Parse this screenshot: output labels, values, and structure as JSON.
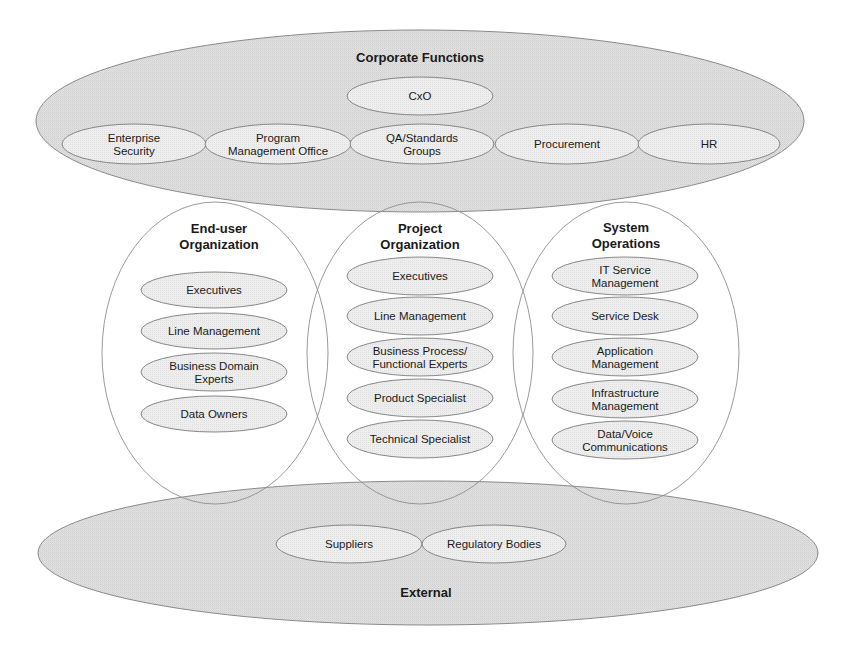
{
  "colors": {
    "outer_fill": "#d9d9d9",
    "item_fill_on_gray": "#eeeeee",
    "item_fill_in_circle": "#e3e3e3",
    "circle_fill": "#ffffff",
    "stroke": "#8a8a8a",
    "text": "#1a1a1a"
  },
  "corporate": {
    "title": "Corporate Functions",
    "shape": {
      "cx": 420,
      "cy": 121,
      "rx": 384,
      "ry": 91
    },
    "title_pos": {
      "x": 420,
      "y": 57
    },
    "items": [
      {
        "id": "cxo",
        "lines": [
          "CxO"
        ],
        "cx": 420,
        "cy": 96,
        "rx": 73,
        "ry": 19
      },
      {
        "id": "enterprise-security",
        "lines": [
          "Enterprise",
          "Security"
        ],
        "cx": 134,
        "cy": 144,
        "rx": 72,
        "ry": 20
      },
      {
        "id": "program-management-office",
        "lines": [
          "Program",
          "Management Office"
        ],
        "cx": 278,
        "cy": 144,
        "rx": 73,
        "ry": 20
      },
      {
        "id": "qa-standards-groups",
        "lines": [
          "QA/Standards",
          "Groups"
        ],
        "cx": 422,
        "cy": 144,
        "rx": 72,
        "ry": 20
      },
      {
        "id": "procurement",
        "lines": [
          "Procurement"
        ],
        "cx": 567,
        "cy": 144,
        "rx": 72,
        "ry": 20
      },
      {
        "id": "hr",
        "lines": [
          "HR"
        ],
        "cx": 709,
        "cy": 144,
        "rx": 71,
        "ry": 20
      }
    ]
  },
  "external": {
    "title": "External",
    "shape": {
      "cx": 428,
      "cy": 553,
      "rx": 390,
      "ry": 72
    },
    "title_pos": {
      "x": 426,
      "y": 592
    },
    "items": [
      {
        "id": "suppliers",
        "lines": [
          "Suppliers"
        ],
        "cx": 349,
        "cy": 544,
        "rx": 73,
        "ry": 19
      },
      {
        "id": "regulatory-bodies",
        "lines": [
          "Regulatory Bodies"
        ],
        "cx": 494,
        "cy": 544,
        "rx": 72,
        "ry": 19
      }
    ]
  },
  "circles": [
    {
      "id": "end-user-organization",
      "title_lines": [
        "End-user",
        "Organization"
      ],
      "shape": {
        "cx": 215,
        "cy": 353,
        "rx": 113,
        "ry": 151
      },
      "title_y": [
        228,
        244
      ],
      "item_cx": 214,
      "item_rx": 73,
      "items": [
        {
          "lines": [
            "Executives"
          ],
          "cy": 290,
          "ry": 18
        },
        {
          "lines": [
            "Line Management"
          ],
          "cy": 331,
          "ry": 18
        },
        {
          "lines": [
            "Business Domain",
            "Experts"
          ],
          "cy": 372,
          "ry": 19
        },
        {
          "lines": [
            "Data Owners"
          ],
          "cy": 414,
          "ry": 18
        }
      ]
    },
    {
      "id": "project-organization",
      "title_lines": [
        "Project",
        "Organization"
      ],
      "shape": {
        "cx": 420,
        "cy": 353,
        "rx": 113,
        "ry": 151
      },
      "title_y": [
        228,
        244
      ],
      "item_cx": 420,
      "item_rx": 73,
      "items": [
        {
          "lines": [
            "Executives"
          ],
          "cy": 276,
          "ry": 19
        },
        {
          "lines": [
            "Line Management"
          ],
          "cy": 316,
          "ry": 19
        },
        {
          "lines": [
            "Business Process/",
            "Functional Experts"
          ],
          "cy": 357,
          "ry": 19
        },
        {
          "lines": [
            "Product Specialist"
          ],
          "cy": 398,
          "ry": 19
        },
        {
          "lines": [
            "Technical Specialist"
          ],
          "cy": 439,
          "ry": 19
        }
      ]
    },
    {
      "id": "system-operations",
      "title_lines": [
        "System",
        "Operations"
      ],
      "shape": {
        "cx": 626,
        "cy": 353,
        "rx": 113,
        "ry": 151
      },
      "title_y": [
        227,
        243
      ],
      "item_cx": 625,
      "item_rx": 73,
      "items": [
        {
          "lines": [
            "IT Service",
            "Management"
          ],
          "cy": 276,
          "ry": 19
        },
        {
          "lines": [
            "Service Desk"
          ],
          "cy": 316,
          "ry": 19
        },
        {
          "lines": [
            "Application",
            "Management"
          ],
          "cy": 357,
          "ry": 19
        },
        {
          "lines": [
            "Infrastructure",
            "Management"
          ],
          "cy": 399,
          "ry": 19
        },
        {
          "lines": [
            "Data/Voice",
            "Communications"
          ],
          "cy": 440,
          "ry": 19
        }
      ]
    }
  ]
}
